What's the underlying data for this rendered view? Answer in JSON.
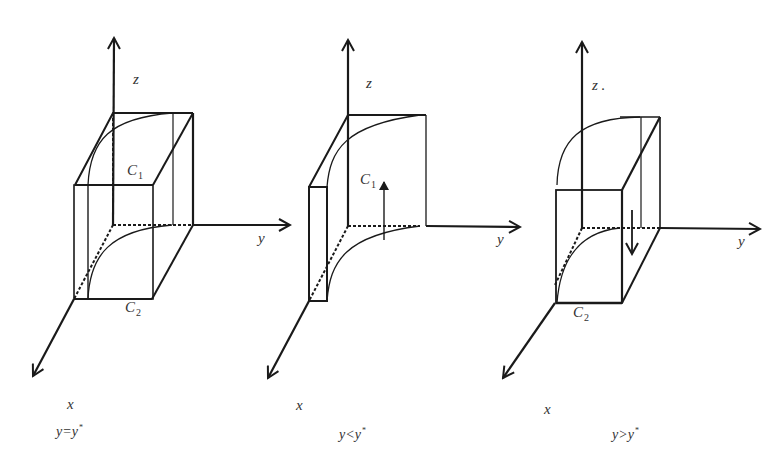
{
  "figure": {
    "panels": [
      {
        "id": "equal",
        "axis_labels": {
          "z": "z",
          "y": "y",
          "x": "x"
        },
        "curve_labels": {
          "c1_main": "C",
          "c1_sub": "1",
          "c2_main": "C",
          "c2_sub": "2"
        },
        "caption": {
          "lhs": "y",
          "op": "=",
          "rhs": "y",
          "star": "*"
        }
      },
      {
        "id": "less",
        "axis_labels": {
          "z": "z",
          "y": "y",
          "x": "x"
        },
        "curve_labels": {
          "c1_main": "C",
          "c1_sub": "1"
        },
        "caption": {
          "lhs": "y",
          "op": "<",
          "rhs": "y",
          "star": "*"
        }
      },
      {
        "id": "greater",
        "axis_labels": {
          "z": "z .",
          "y": "y",
          "x": "x"
        },
        "curve_labels": {
          "c2_main": "C",
          "c2_sub": "2"
        },
        "caption": {
          "lhs": "y",
          "op": ">",
          "rhs": "y",
          "star": "*"
        }
      }
    ],
    "colors": {
      "line": "#1a1a1a",
      "text": "#333333",
      "background": "#ffffff"
    }
  }
}
